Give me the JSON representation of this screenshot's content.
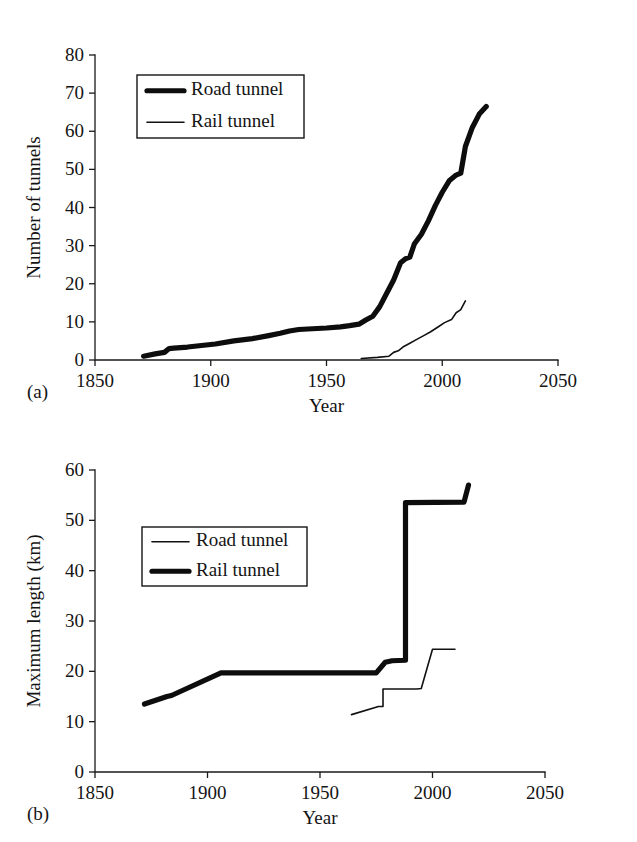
{
  "figure": {
    "panels": [
      {
        "id": "a",
        "panel_label": "(a)",
        "xlabel": "Year",
        "ylabel": "Number of tunnels"
      },
      {
        "id": "b",
        "panel_label": "(b)",
        "xlabel": "Year",
        "ylabel": "Maximum length (km)"
      }
    ]
  },
  "chart_data": [
    {
      "type": "line",
      "panel": "a",
      "title": "",
      "xlabel": "Year",
      "ylabel": "Number of tunnels",
      "xlim": [
        1850,
        2050
      ],
      "ylim": [
        0,
        80
      ],
      "xticks": [
        1850,
        1900,
        1950,
        2000,
        2050
      ],
      "yticks": [
        0,
        10,
        20,
        30,
        40,
        50,
        60,
        70,
        80
      ],
      "grid": false,
      "legend_position": "upper-left",
      "series": [
        {
          "name": "Road tunnel",
          "style": "thick",
          "x": [
            1871,
            1876,
            1880,
            1882,
            1884,
            1890,
            1896,
            1902,
            1910,
            1918,
            1925,
            1930,
            1934,
            1938,
            1944,
            1950,
            1956,
            1960,
            1964,
            1967,
            1970,
            1973,
            1976,
            1979,
            1982,
            1984,
            1986,
            1988,
            1991,
            1994,
            1997,
            2000,
            2003,
            2006,
            2008,
            2010,
            2013,
            2016,
            2019
          ],
          "y": [
            1.0,
            1.6,
            2.0,
            3.0,
            3.1,
            3.4,
            3.8,
            4.2,
            5.0,
            5.6,
            6.4,
            7.0,
            7.6,
            8.0,
            8.2,
            8.4,
            8.7,
            9.0,
            9.4,
            10.5,
            11.5,
            14.0,
            17.5,
            21.0,
            25.5,
            26.5,
            27.0,
            30.5,
            33.0,
            36.5,
            40.5,
            44.0,
            47.0,
            48.5,
            49.0,
            56.0,
            61.0,
            64.5,
            66.5
          ]
        },
        {
          "name": "Rail tunnel",
          "style": "thin",
          "x": [
            1965,
            1972,
            1977,
            1979,
            1981,
            1983,
            1986,
            1989,
            1992,
            1995,
            1998,
            2001,
            2004,
            2006,
            2008,
            2010
          ],
          "y": [
            0.4,
            0.7,
            1.0,
            2.0,
            2.4,
            3.4,
            4.4,
            5.4,
            6.4,
            7.4,
            8.6,
            9.8,
            10.6,
            12.4,
            13.2,
            15.5
          ]
        }
      ]
    },
    {
      "type": "line",
      "panel": "b",
      "title": "",
      "xlabel": "Year",
      "ylabel": "Maximum length (km)",
      "xlim": [
        1850,
        2050
      ],
      "ylim": [
        0,
        60
      ],
      "xticks": [
        1850,
        1900,
        1950,
        2000,
        2050
      ],
      "yticks": [
        0,
        10,
        20,
        30,
        40,
        50,
        60
      ],
      "grid": false,
      "legend_position": "upper-left",
      "series": [
        {
          "name": "Road tunnel",
          "style": "thin",
          "x": [
            1964,
            1976,
            1978,
            1978,
            1993,
            1995,
            1995,
            2000,
            2000,
            2010
          ],
          "y": [
            11.4,
            13.0,
            13.0,
            16.5,
            16.5,
            16.6,
            16.6,
            24.4,
            24.4,
            24.4
          ]
        },
        {
          "name": "Rail tunnel",
          "style": "thick",
          "x": [
            1872,
            1882,
            1884,
            1906,
            1906,
            1975,
            1979,
            1982,
            1982,
            1988,
            1988,
            2014,
            2014,
            2016
          ],
          "y": [
            13.5,
            15.0,
            15.2,
            19.7,
            19.7,
            19.7,
            21.8,
            22.1,
            22.1,
            22.2,
            53.5,
            53.6,
            53.6,
            57.0
          ]
        }
      ]
    }
  ],
  "legends": {
    "a": {
      "entries": [
        {
          "label": "Road tunnel",
          "style": "thick"
        },
        {
          "label": "Rail tunnel",
          "style": "thin"
        }
      ]
    },
    "b": {
      "entries": [
        {
          "label": "Road tunnel",
          "style": "thin"
        },
        {
          "label": "Rail tunnel",
          "style": "thick"
        }
      ]
    }
  },
  "colors": {
    "line": "#0d0d0d",
    "axis": "#1a1a1a",
    "text": "#141414",
    "background": "#ffffff"
  }
}
